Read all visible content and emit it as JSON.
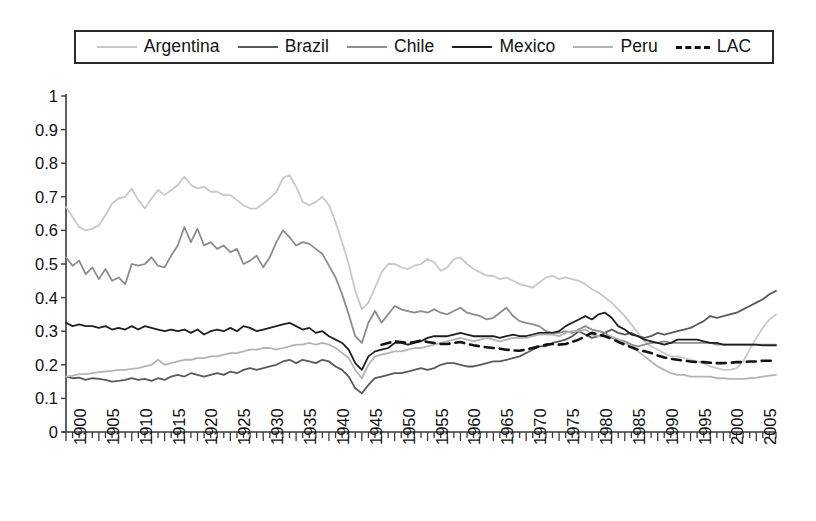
{
  "chart_data": {
    "type": "line",
    "title": "",
    "xlabel": "",
    "ylabel": "",
    "xlim": [
      1900,
      2008
    ],
    "ylim": [
      0,
      1
    ],
    "yticks": [
      "0",
      "0.1",
      "0.2",
      "0.3",
      "0.4",
      "0.5",
      "0.6",
      "0.7",
      "0.8",
      "0.9",
      "1"
    ],
    "xticks": [
      "1900",
      "1905",
      "1910",
      "1915",
      "1920",
      "1925",
      "1930",
      "1935",
      "1940",
      "1945",
      "1950",
      "1955",
      "1960",
      "1965",
      "1970",
      "1975",
      "1980",
      "1985",
      "1990",
      "1995",
      "2000",
      "2005"
    ],
    "xtick_step": 5,
    "minor_tick_step": 1,
    "grid": false,
    "legend_position": "top",
    "series": [
      {
        "name": "Argentina",
        "color": "#c8c8c8",
        "style": "solid",
        "x_start": 1900,
        "values": [
          0.67,
          0.64,
          0.61,
          0.6,
          0.605,
          0.615,
          0.645,
          0.68,
          0.695,
          0.7,
          0.725,
          0.69,
          0.665,
          0.695,
          0.72,
          0.705,
          0.72,
          0.735,
          0.76,
          0.735,
          0.725,
          0.73,
          0.715,
          0.715,
          0.705,
          0.705,
          0.69,
          0.675,
          0.665,
          0.665,
          0.68,
          0.695,
          0.715,
          0.755,
          0.765,
          0.73,
          0.685,
          0.675,
          0.685,
          0.7,
          0.675,
          0.625,
          0.565,
          0.5,
          0.42,
          0.365,
          0.385,
          0.43,
          0.475,
          0.5,
          0.5,
          0.49,
          0.485,
          0.495,
          0.5,
          0.515,
          0.505,
          0.48,
          0.49,
          0.515,
          0.52,
          0.5,
          0.485,
          0.475,
          0.465,
          0.465,
          0.455,
          0.46,
          0.45,
          0.44,
          0.435,
          0.43,
          0.445,
          0.46,
          0.465,
          0.455,
          0.46,
          0.455,
          0.45,
          0.44,
          0.425,
          0.415,
          0.4,
          0.385,
          0.365,
          0.345,
          0.32,
          0.295,
          0.27,
          0.255,
          0.245,
          0.235,
          0.225,
          0.225,
          0.22,
          0.215,
          0.21,
          0.205,
          0.195,
          0.19,
          0.185,
          0.185,
          0.19,
          0.21,
          0.245,
          0.28,
          0.31,
          0.335,
          0.35
        ]
      },
      {
        "name": "Brazil",
        "color": "#595959",
        "style": "solid",
        "x_start": 1900,
        "values": [
          0.165,
          0.16,
          0.162,
          0.155,
          0.16,
          0.158,
          0.155,
          0.15,
          0.152,
          0.155,
          0.16,
          0.155,
          0.158,
          0.152,
          0.16,
          0.155,
          0.165,
          0.17,
          0.165,
          0.175,
          0.17,
          0.165,
          0.17,
          0.175,
          0.17,
          0.18,
          0.175,
          0.185,
          0.19,
          0.185,
          0.19,
          0.195,
          0.2,
          0.21,
          0.215,
          0.205,
          0.215,
          0.21,
          0.205,
          0.215,
          0.21,
          0.195,
          0.185,
          0.165,
          0.13,
          0.115,
          0.14,
          0.16,
          0.165,
          0.17,
          0.175,
          0.175,
          0.18,
          0.185,
          0.19,
          0.185,
          0.19,
          0.2,
          0.205,
          0.205,
          0.2,
          0.195,
          0.195,
          0.2,
          0.205,
          0.21,
          0.21,
          0.215,
          0.22,
          0.225,
          0.235,
          0.245,
          0.255,
          0.255,
          0.265,
          0.27,
          0.275,
          0.285,
          0.3,
          0.29,
          0.28,
          0.285,
          0.295,
          0.305,
          0.295,
          0.29,
          0.295,
          0.285,
          0.28,
          0.285,
          0.295,
          0.29,
          0.295,
          0.3,
          0.305,
          0.31,
          0.32,
          0.33,
          0.345,
          0.34,
          0.345,
          0.35,
          0.355,
          0.365,
          0.375,
          0.385,
          0.395,
          0.41,
          0.42
        ]
      },
      {
        "name": "Chile",
        "color": "#8c8c8c",
        "style": "solid",
        "x_start": 1900,
        "values": [
          0.52,
          0.495,
          0.51,
          0.47,
          0.49,
          0.455,
          0.485,
          0.45,
          0.46,
          0.44,
          0.5,
          0.495,
          0.5,
          0.52,
          0.495,
          0.49,
          0.525,
          0.555,
          0.61,
          0.565,
          0.605,
          0.555,
          0.565,
          0.545,
          0.555,
          0.535,
          0.545,
          0.5,
          0.51,
          0.525,
          0.49,
          0.52,
          0.565,
          0.6,
          0.58,
          0.555,
          0.565,
          0.56,
          0.545,
          0.53,
          0.495,
          0.46,
          0.41,
          0.35,
          0.285,
          0.265,
          0.325,
          0.36,
          0.325,
          0.35,
          0.375,
          0.365,
          0.36,
          0.355,
          0.36,
          0.355,
          0.365,
          0.355,
          0.35,
          0.36,
          0.37,
          0.355,
          0.35,
          0.345,
          0.335,
          0.34,
          0.355,
          0.37,
          0.345,
          0.33,
          0.325,
          0.32,
          0.315,
          0.3,
          0.295,
          0.295,
          0.3,
          0.295,
          0.305,
          0.315,
          0.305,
          0.3,
          0.295,
          0.28,
          0.275,
          0.27,
          0.26,
          0.255,
          0.26,
          0.265,
          0.265,
          0.27,
          0.265,
          0.265,
          0.265,
          0.265,
          0.265,
          0.265,
          0.265,
          0.26,
          0.26,
          0.26,
          0.26,
          0.26,
          0.26,
          0.26,
          0.26,
          0.26,
          0.26
        ]
      },
      {
        "name": "Mexico",
        "color": "#1f1f1f",
        "style": "solid",
        "x_start": 1900,
        "values": [
          0.325,
          0.315,
          0.32,
          0.315,
          0.315,
          0.31,
          0.315,
          0.305,
          0.31,
          0.305,
          0.315,
          0.305,
          0.315,
          0.31,
          0.305,
          0.3,
          0.305,
          0.3,
          0.305,
          0.295,
          0.305,
          0.29,
          0.3,
          0.305,
          0.3,
          0.31,
          0.3,
          0.315,
          0.31,
          0.3,
          0.305,
          0.31,
          0.315,
          0.32,
          0.325,
          0.315,
          0.305,
          0.31,
          0.295,
          0.3,
          0.285,
          0.275,
          0.265,
          0.245,
          0.205,
          0.185,
          0.225,
          0.24,
          0.245,
          0.25,
          0.265,
          0.265,
          0.26,
          0.265,
          0.27,
          0.28,
          0.285,
          0.285,
          0.285,
          0.29,
          0.295,
          0.29,
          0.285,
          0.285,
          0.285,
          0.285,
          0.28,
          0.285,
          0.29,
          0.285,
          0.285,
          0.29,
          0.295,
          0.295,
          0.295,
          0.3,
          0.315,
          0.325,
          0.335,
          0.345,
          0.335,
          0.35,
          0.355,
          0.34,
          0.315,
          0.305,
          0.29,
          0.285,
          0.275,
          0.27,
          0.265,
          0.26,
          0.265,
          0.275,
          0.275,
          0.275,
          0.275,
          0.27,
          0.265,
          0.265,
          0.26,
          0.26,
          0.26,
          0.26,
          0.26,
          0.26,
          0.258,
          0.258,
          0.258
        ]
      },
      {
        "name": "Peru",
        "color": "#b4b4b4",
        "style": "solid",
        "x_start": 1900,
        "values": [
          0.165,
          0.168,
          0.172,
          0.172,
          0.175,
          0.178,
          0.18,
          0.182,
          0.185,
          0.185,
          0.188,
          0.19,
          0.195,
          0.2,
          0.215,
          0.2,
          0.205,
          0.21,
          0.215,
          0.215,
          0.22,
          0.22,
          0.225,
          0.225,
          0.23,
          0.235,
          0.235,
          0.24,
          0.245,
          0.245,
          0.25,
          0.25,
          0.245,
          0.25,
          0.255,
          0.26,
          0.26,
          0.265,
          0.26,
          0.265,
          0.26,
          0.25,
          0.235,
          0.22,
          0.185,
          0.16,
          0.2,
          0.225,
          0.23,
          0.235,
          0.24,
          0.24,
          0.245,
          0.25,
          0.25,
          0.255,
          0.26,
          0.265,
          0.27,
          0.275,
          0.28,
          0.275,
          0.27,
          0.275,
          0.28,
          0.275,
          0.27,
          0.275,
          0.28,
          0.28,
          0.28,
          0.285,
          0.29,
          0.29,
          0.29,
          0.285,
          0.295,
          0.3,
          0.3,
          0.305,
          0.29,
          0.285,
          0.285,
          0.285,
          0.275,
          0.265,
          0.255,
          0.24,
          0.225,
          0.21,
          0.195,
          0.185,
          0.175,
          0.17,
          0.17,
          0.165,
          0.165,
          0.165,
          0.165,
          0.16,
          0.16,
          0.158,
          0.158,
          0.158,
          0.16,
          0.162,
          0.165,
          0.168,
          0.17
        ]
      },
      {
        "name": "LAC",
        "color": "#111111",
        "style": "dashed",
        "x_start": 1948,
        "values": [
          0.26,
          0.265,
          0.27,
          0.268,
          0.265,
          0.268,
          0.272,
          0.268,
          0.265,
          0.262,
          0.262,
          0.265,
          0.268,
          0.262,
          0.258,
          0.255,
          0.252,
          0.25,
          0.248,
          0.245,
          0.243,
          0.242,
          0.245,
          0.25,
          0.255,
          0.26,
          0.262,
          0.26,
          0.262,
          0.268,
          0.275,
          0.285,
          0.295,
          0.29,
          0.285,
          0.278,
          0.268,
          0.26,
          0.252,
          0.245,
          0.24,
          0.235,
          0.228,
          0.222,
          0.218,
          0.215,
          0.212,
          0.21,
          0.208,
          0.208,
          0.206,
          0.205,
          0.205,
          0.206,
          0.208,
          0.208,
          0.21,
          0.21,
          0.212,
          0.212,
          0.212
        ]
      }
    ]
  },
  "legend": {
    "items": [
      {
        "label": "Argentina",
        "color": "#c8c8c8",
        "style": "solid"
      },
      {
        "label": "Brazil",
        "color": "#595959",
        "style": "solid"
      },
      {
        "label": "Chile",
        "color": "#8c8c8c",
        "style": "solid"
      },
      {
        "label": "Mexico",
        "color": "#1f1f1f",
        "style": "solid"
      },
      {
        "label": "Peru",
        "color": "#b4b4b4",
        "style": "solid"
      },
      {
        "label": "LAC",
        "color": "#111111",
        "style": "dashed"
      }
    ]
  },
  "axes": {
    "axis_color": "#3a3a3a"
  }
}
